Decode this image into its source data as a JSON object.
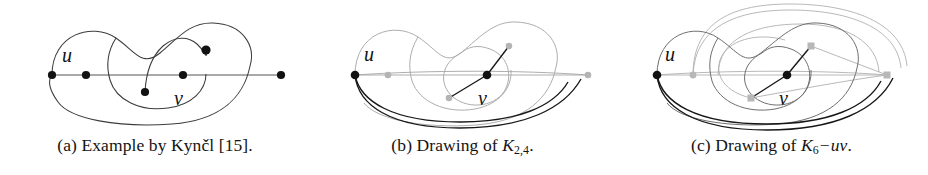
{
  "figure": {
    "background_color": "#ffffff",
    "ink_color": "#1a1a1a",
    "faint_ink_color": "#9a9a9a",
    "subfigures": [
      {
        "id": "a",
        "tag": "(a)",
        "caption_text": "(a) Example by Kynčl [15].",
        "caption_prefix": "(a) Example by Kynčl [15].",
        "reference_number": "[15]",
        "author_cited": "Kynčl",
        "vertex_labels": [
          "u",
          "v"
        ],
        "vertex_count": 6,
        "style": "all-black-vertices"
      },
      {
        "id": "b",
        "tag": "(b)",
        "caption_lead": "(b) Drawing of ",
        "caption_symbol": "K",
        "caption_subscript": "2,4",
        "caption_tail": ".",
        "caption_text": "(b) Drawing of K2,4.",
        "vertex_labels": [
          "u",
          "v"
        ],
        "vertex_count": 6,
        "style": "two-black-vertices"
      },
      {
        "id": "c",
        "tag": "(c)",
        "caption_lead": "(c) Drawing of ",
        "caption_symbol": "K",
        "caption_subscript": "6",
        "caption_minus": "−",
        "caption_removed_edge": "uv",
        "caption_tail": ".",
        "caption_text": "(c) Drawing of K6 − uv.",
        "vertex_labels": [
          "u",
          "v"
        ],
        "vertex_count": 6,
        "style": "two-black-vertices"
      }
    ]
  }
}
